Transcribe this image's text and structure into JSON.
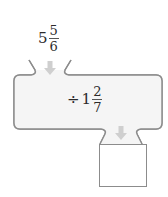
{
  "diagram": {
    "type": "function-machine",
    "input": {
      "whole": "5",
      "numerator": "5",
      "denominator": "6"
    },
    "operation": {
      "operator": "÷",
      "whole": "1",
      "numerator": "2",
      "denominator": "7"
    },
    "output": {
      "value": ""
    },
    "colors": {
      "machine_fill": "#f4f4f4",
      "machine_stroke": "#8c8c8c",
      "arrow": "#cfcfcf",
      "text": "#2b2b2b"
    },
    "icons": {
      "input_arrow": "arrow-down-icon",
      "output_arrow": "arrow-down-icon"
    }
  }
}
